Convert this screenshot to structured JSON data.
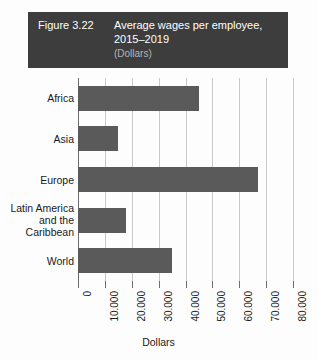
{
  "header": {
    "figure_number": "Figure 3.22",
    "title": "Average wages per employee, 2015–2019",
    "unit": "(Dollars)",
    "background_color": "#3d3d3d",
    "text_color": "#ffffff",
    "unit_color": "#b4b4b4"
  },
  "chart_data": {
    "type": "bar",
    "orientation": "horizontal",
    "title": "Average wages per employee, 2015–2019",
    "subtitle": "(Dollars)",
    "categories": [
      "Africa",
      "Asia",
      "Europe",
      "Latin America and the Caribbean",
      "World"
    ],
    "category_lines": [
      [
        "Africa"
      ],
      [
        "Asia"
      ],
      [
        "Europe"
      ],
      [
        "Latin America",
        "and the",
        "Caribbean"
      ],
      [
        "World"
      ]
    ],
    "values": [
      45000,
      15000,
      67000,
      18000,
      35000
    ],
    "xlabel": "Dollars",
    "ylabel": "",
    "xlim": [
      0,
      80000
    ],
    "xticks": [
      0,
      10000,
      20000,
      30000,
      40000,
      50000,
      60000,
      70000,
      80000
    ],
    "xtick_labels": [
      "0",
      "10.000",
      "20.000",
      "30.000",
      "40.000",
      "50.000",
      "60.000",
      "70.000",
      "80.000"
    ],
    "grid": true,
    "grid_axis": "x",
    "legend": false,
    "bar_color": "#5a5a5a",
    "gridline_color": "#c9c9c9",
    "axis_color": "#6e6e6e"
  }
}
